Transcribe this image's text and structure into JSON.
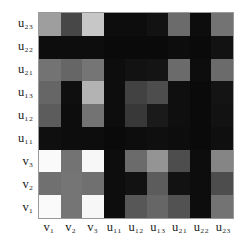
{
  "figure": {
    "title": "",
    "background_color": "#ffffff",
    "border_color": "#9a9a9a"
  },
  "chart_data": {
    "type": "heatmap",
    "title": "",
    "xlabel": "",
    "ylabel": "",
    "colormap": "grayscale",
    "grid": false,
    "legend": "none",
    "value_range": [
      0,
      1
    ],
    "note": "Grayscale intensity matrix; 0 = black, 1 = white",
    "x": [
      "v1",
      "v2",
      "v3",
      "u11",
      "u12",
      "u13",
      "u21",
      "u22",
      "u23"
    ],
    "x_tick_labels": [
      "v₁",
      "v₂",
      "v₃",
      "u₁₁",
      "u₁₂",
      "u₁₃",
      "u₂₁",
      "u₂₂",
      "u₂₃"
    ],
    "y": [
      "u23",
      "u22",
      "u21",
      "u13",
      "u12",
      "u11",
      "v3",
      "v2",
      "v1"
    ],
    "y_tick_labels": [
      "u₂₃",
      "u₂₂",
      "u₂₁",
      "u₁₃",
      "u₁₂",
      "u₁₁",
      "v₃",
      "v₂",
      "v₁"
    ],
    "rows": [
      {
        "label": "u23",
        "values": [
          0.62,
          0.28,
          0.78,
          0.05,
          0.05,
          0.07,
          0.42,
          0.05,
          0.45
        ]
      },
      {
        "label": "u22",
        "values": [
          0.05,
          0.05,
          0.05,
          0.04,
          0.04,
          0.04,
          0.05,
          0.04,
          0.07
        ]
      },
      {
        "label": "u21",
        "values": [
          0.45,
          0.4,
          0.46,
          0.05,
          0.07,
          0.08,
          0.42,
          0.05,
          0.42
        ]
      },
      {
        "label": "u13",
        "values": [
          0.4,
          0.06,
          0.7,
          0.05,
          0.26,
          0.3,
          0.06,
          0.04,
          0.08
        ]
      },
      {
        "label": "u12",
        "values": [
          0.36,
          0.05,
          0.45,
          0.05,
          0.22,
          0.1,
          0.06,
          0.04,
          0.07
        ]
      },
      {
        "label": "u11",
        "values": [
          0.06,
          0.05,
          0.05,
          0.04,
          0.05,
          0.06,
          0.05,
          0.04,
          0.06
        ]
      },
      {
        "label": "v3",
        "values": [
          0.98,
          0.45,
          0.97,
          0.05,
          0.42,
          0.58,
          0.3,
          0.05,
          0.52
        ]
      },
      {
        "label": "v2",
        "values": [
          0.44,
          0.46,
          0.44,
          0.05,
          0.07,
          0.36,
          0.07,
          0.05,
          0.3
        ]
      },
      {
        "label": "v1",
        "values": [
          0.98,
          0.46,
          0.97,
          0.05,
          0.34,
          0.4,
          0.32,
          0.05,
          0.45
        ]
      }
    ]
  }
}
